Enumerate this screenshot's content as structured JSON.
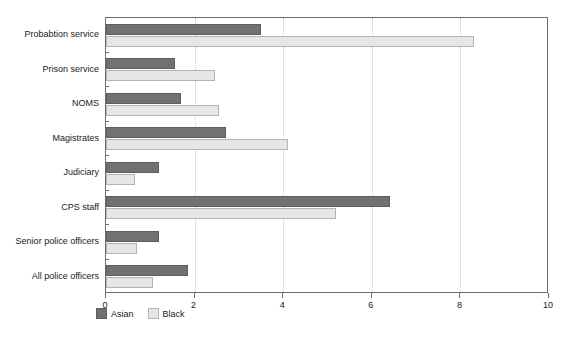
{
  "chart_data": {
    "type": "bar",
    "orientation": "horizontal",
    "title": "",
    "xlabel": "",
    "ylabel": "",
    "xlim": [
      0,
      10
    ],
    "xticks": [
      0,
      2,
      4,
      6,
      8,
      10
    ],
    "xtick_labels": [
      "0",
      "2",
      "4",
      "6",
      "8",
      "10"
    ],
    "grid": "vertical-dotted",
    "legend_position": "bottom-left",
    "categories": [
      "Probabtion service",
      "Prison service",
      "NOMS",
      "Magistrates",
      "Judiciary",
      "CPS staff",
      "Senior police officers",
      "All police officers"
    ],
    "series": [
      {
        "name": "Asian",
        "color": "#717171",
        "values": [
          3.5,
          1.55,
          1.7,
          2.7,
          1.2,
          6.4,
          1.2,
          1.85
        ]
      },
      {
        "name": "Black",
        "color": "#e6e6e6",
        "values": [
          8.3,
          2.45,
          2.55,
          4.1,
          0.65,
          5.2,
          0.7,
          1.05
        ]
      }
    ]
  },
  "legend": {
    "items": [
      {
        "label": "Asian",
        "swatch": "asian"
      },
      {
        "label": "Black",
        "swatch": "black"
      }
    ]
  },
  "colors": {
    "asian_fill": "#717171",
    "asian_border": "#5e5e5e",
    "black_fill": "#e6e6e6",
    "black_border": "#b3b3b3",
    "axis": "#6d6d6d",
    "gridline": "#c9c9c9",
    "text": "#1a1a1a",
    "background": "#ffffff"
  }
}
